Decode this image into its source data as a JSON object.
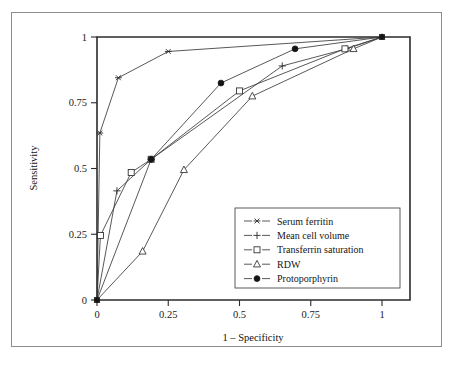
{
  "chart_data": {
    "type": "line",
    "title": "",
    "xlabel": "1 – Specificity",
    "ylabel": "Sensitivity",
    "xlim": [
      0,
      1.08
    ],
    "ylim": [
      0,
      1.04
    ],
    "xticks": [
      "0",
      "0.25",
      "0.5",
      "0.75",
      "1"
    ],
    "xtick_values": [
      0,
      0.25,
      0.5,
      0.75,
      1
    ],
    "yticks": [
      "0",
      "0.25",
      "0.5",
      "0.75",
      "1"
    ],
    "ytick_values": [
      0,
      0.25,
      0.5,
      0.75,
      1
    ],
    "grid": false,
    "legend_position": "lower-right-inside",
    "series": [
      {
        "name": "Serum ferritin",
        "marker": "star",
        "x": [
          0,
          0.01,
          0.075,
          0.25,
          1.0
        ],
        "y": [
          0,
          0.635,
          0.845,
          0.945,
          1.0
        ]
      },
      {
        "name": "Mean cell volume",
        "marker": "plus",
        "x": [
          0,
          0.07,
          0.19,
          0.65,
          0.875,
          1.0
        ],
        "y": [
          0,
          0.415,
          0.535,
          0.89,
          0.955,
          1.0
        ]
      },
      {
        "name": "Transferrin saturation",
        "marker": "square",
        "x": [
          0,
          0.012,
          0.12,
          0.19,
          0.5,
          0.87,
          1.0
        ],
        "y": [
          0,
          0.245,
          0.485,
          0.535,
          0.795,
          0.955,
          1.0
        ]
      },
      {
        "name": "RDW",
        "marker": "triangle",
        "x": [
          0,
          0.16,
          0.305,
          0.545,
          0.9,
          1.0
        ],
        "y": [
          0,
          0.185,
          0.495,
          0.775,
          0.955,
          1.0
        ]
      },
      {
        "name": "Protoporphyrin",
        "marker": "circle-filled",
        "x": [
          0,
          0.19,
          0.435,
          0.695,
          1.0
        ],
        "y": [
          0,
          0.535,
          0.825,
          0.955,
          1.0
        ]
      }
    ]
  },
  "legend": {
    "entries": [
      {
        "label": "Serum ferritin",
        "marker": "star"
      },
      {
        "label": "Mean cell volume",
        "marker": "plus"
      },
      {
        "label": "Transferrin saturation",
        "marker": "square"
      },
      {
        "label": "RDW",
        "marker": "triangle"
      },
      {
        "label": "Protoporphyrin",
        "marker": "circle-filled"
      }
    ]
  },
  "colors": {
    "line": "#3a3a3a",
    "axis": "#2b2b2b",
    "marker_fill_open": "#ffffff",
    "marker_fill_solid": "#151515",
    "frame": "#8c8c8c",
    "background": "#ffffff"
  }
}
